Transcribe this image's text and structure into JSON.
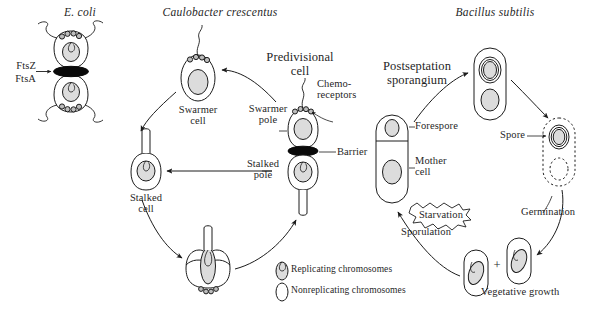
{
  "figure": {
    "background_color": "#ffffff",
    "line_color": "#1c1c1c",
    "chromosome_fill": "#dcdcdc",
    "septum_color": "#0a0a0a",
    "width": 598,
    "height": 318
  },
  "species": {
    "ecoli": "E. coli",
    "caulobacter": "Caulobacter crescentus",
    "bacillus": "Bacillus subtilis"
  },
  "ecoli_panel": {
    "ftsz_label": "FtsZ",
    "ftsa_label": "FtsA"
  },
  "caulobacter_panel": {
    "swarmer_cell": "Swarmer\ncell",
    "stalked_cell": "Stalked\ncell",
    "predivisional_cell": "Predivisional\ncell",
    "swarmer_pole": "Swarmer\npole",
    "stalked_pole": "Stalked\npole",
    "chemoreceptors": "Chemo-\nreceptors",
    "barrier": "Barrier"
  },
  "bacillus_panel": {
    "postseptation_sporangium": "Postseptation\nsporangium",
    "forespore": "Forespore",
    "mother_cell": "Mother\ncell",
    "spore": "Spore",
    "germination": "Germination",
    "vegetative_growth": "Vegetative growth",
    "sporulation": "Sporulation",
    "starvation": "Starvation",
    "plus_sign": "+"
  },
  "legend": {
    "replicating": "Replicating chromosomes",
    "nonreplicating": "Nonreplicating chromosomes"
  }
}
